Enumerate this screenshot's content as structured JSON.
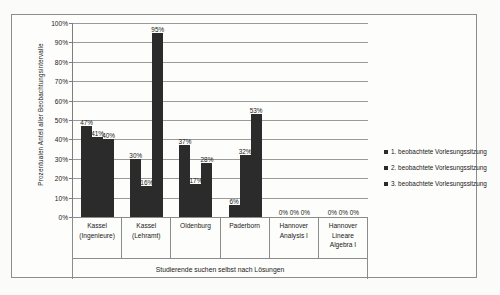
{
  "chart_data": {
    "type": "bar",
    "title": "",
    "xlabel": "Studierende suchen selbst nach Lösungen",
    "ylabel": "Prozentualen Anteil aller Beobachtungsintervalle",
    "ylim": [
      0,
      100
    ],
    "grid": true,
    "legend_position": "right",
    "y_ticks": [
      "0%",
      "10%",
      "20%",
      "30%",
      "40%",
      "50%",
      "60%",
      "70%",
      "80%",
      "90%",
      "100%"
    ],
    "y_tick_values": [
      0,
      10,
      20,
      30,
      40,
      50,
      60,
      70,
      80,
      90,
      100
    ],
    "categories": [
      "Kassel (Ingenieure)",
      "Kassel (Lehramt)",
      "Oldenburg",
      "Paderborn",
      "Hannover Analysis I",
      "Hannover Lineare Algebra I"
    ],
    "category_lines": [
      [
        "Kassel",
        "(Ingenieure)"
      ],
      [
        "Kassel",
        "(Lehramt)"
      ],
      [
        "Oldenburg"
      ],
      [
        "Paderborn"
      ],
      [
        "Hannover",
        "Analysis I"
      ],
      [
        "Hannover",
        "Lineare",
        "Algebra I"
      ]
    ],
    "series": [
      {
        "name": "1. beobachtete Vorlesungssitzung",
        "values": [
          47,
          30,
          37,
          6,
          0,
          0
        ],
        "labels": [
          "47%",
          "30%",
          "37%",
          "6%",
          "0%",
          "0%"
        ],
        "color": "#2b2b2b"
      },
      {
        "name": "2. beobachtete Vorlesungssitzung",
        "values": [
          41,
          16,
          17,
          32,
          0,
          0
        ],
        "labels": [
          "41%",
          "16%",
          "17%",
          "32%",
          "0%",
          "0%"
        ],
        "color": "#2b2b2b"
      },
      {
        "name": "3. beobachtete Vorlesungssitzung",
        "values": [
          40,
          95,
          28,
          53,
          0,
          0
        ],
        "labels": [
          "40%",
          "95%",
          "28%",
          "53%",
          "0%",
          "0%"
        ],
        "color": "#2b2b2b"
      }
    ]
  },
  "colors": {
    "bar": "#2b2b2b",
    "gridline": "#9a9a9a",
    "frame": "#8c8c8c",
    "background": "#fdfdfb",
    "text": "#1a1a1a"
  }
}
